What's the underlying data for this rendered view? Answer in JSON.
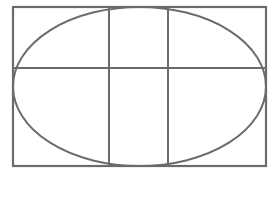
{
  "diagram": {
    "stroke_color": "#6b6b6b",
    "background_color": "#ffffff",
    "rectangle": {
      "x": 13,
      "y": 7,
      "width": 253,
      "height": 159
    },
    "ellipse": {
      "cx": 139.5,
      "cy": 86.5,
      "rx": 126.5,
      "ry": 79.5
    },
    "vertical_lines_x": [
      109,
      168
    ],
    "horizontal_line_y": 68
  }
}
